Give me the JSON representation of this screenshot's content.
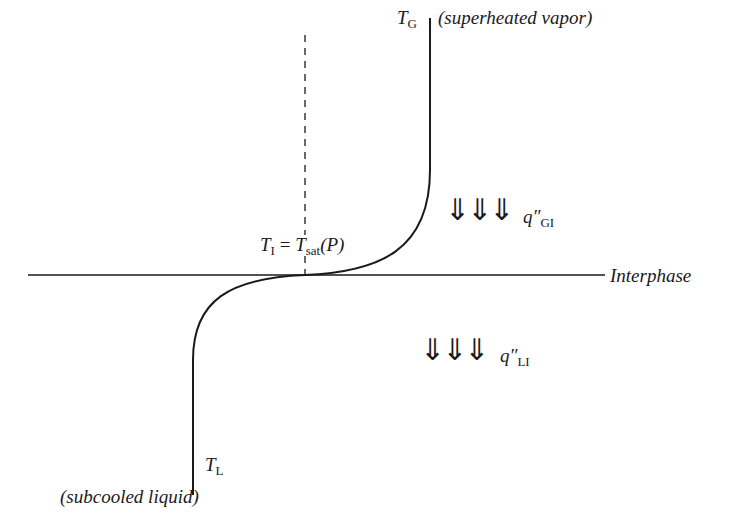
{
  "diagram": {
    "colors": {
      "line": "#1a1a1a",
      "background": "#ffffff"
    },
    "labels": {
      "tg_main": "T",
      "tg_sub": "G",
      "vapor": "(superheated vapor)",
      "ti_main": "T",
      "ti_sub": "I",
      "equals": " = ",
      "tsat_main": "T",
      "tsat_sub": "sat",
      "tsat_arg": "(P)",
      "qgi_main": "q″",
      "qgi_sub": "GI",
      "qli_main": "q″",
      "qli_sub": "LI",
      "interphase": "Interphase",
      "tl_main": "T",
      "tl_sub": "L",
      "liquid": "(subcooled liquid)"
    },
    "arrows": {
      "gas_side": "⇓⇓⇓",
      "liquid_side": "⇓⇓⇓"
    }
  }
}
